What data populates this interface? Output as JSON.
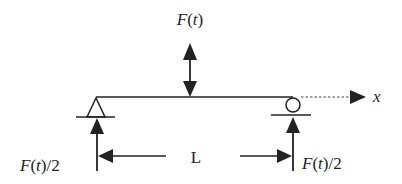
{
  "diagram": {
    "colors": {
      "stroke": "#222222",
      "background": "#ffffff"
    },
    "labels": {
      "applied_force": {
        "F": "F",
        "open": "(",
        "t": "t",
        "close": ")"
      },
      "left_reaction": {
        "F": "F",
        "open": "(",
        "t": "t",
        "close": ")",
        "suffix": "/2"
      },
      "right_reaction": {
        "F": "F",
        "open": "(",
        "t": "t",
        "close": ")",
        "suffix": "/2"
      },
      "span": "L",
      "axis": "x"
    },
    "elements": [
      {
        "id": "beam",
        "type": "line"
      },
      {
        "id": "pin-support",
        "type": "triangle",
        "position": "left"
      },
      {
        "id": "roller-support",
        "type": "circle",
        "position": "right"
      },
      {
        "id": "applied-force-arrow",
        "type": "double-arrow",
        "label": "F(t)"
      },
      {
        "id": "left-reaction-arrow",
        "type": "arrow-up",
        "label": "F(t)/2"
      },
      {
        "id": "right-reaction-arrow",
        "type": "arrow-up",
        "label": "F(t)/2"
      },
      {
        "id": "span-dimension",
        "type": "dimension",
        "label": "L"
      },
      {
        "id": "x-axis",
        "type": "dotted-arrow",
        "label": "x"
      }
    ]
  }
}
